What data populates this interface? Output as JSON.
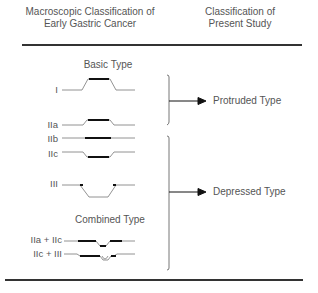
{
  "header": {
    "left_line1": "Macroscopic Classification of",
    "left_line2": "Early Gastric Cancer",
    "right_line1": "Classification of",
    "right_line2": "Present Study"
  },
  "sections": {
    "basic": "Basic Type",
    "combined": "Combined Type"
  },
  "types": [
    {
      "label": "I"
    },
    {
      "label": "IIa"
    },
    {
      "label": "IIb"
    },
    {
      "label": "IIc"
    },
    {
      "label": "III"
    },
    {
      "label": "IIa + IIc"
    },
    {
      "label": "IIc + III"
    }
  ],
  "classes": {
    "protruded": "Protruded Type",
    "depressed": "Depressed Type"
  }
}
